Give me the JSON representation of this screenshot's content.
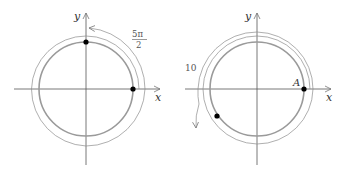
{
  "left_diagram": {
    "axis_x_label": "x",
    "axis_y_label": "y",
    "angle_label_numerator": "5π",
    "angle_label_denominator": "2",
    "points": [
      "start-point-x-axis",
      "end-point-y-axis"
    ]
  },
  "right_diagram": {
    "axis_x_label": "x",
    "axis_y_label": "y",
    "point_label": "A",
    "angle_label": "10",
    "points": [
      "point-A",
      "end-point-third-quadrant"
    ]
  },
  "colors": {
    "circle": "#9a9a9a",
    "spiral": "#8c8c8c",
    "axis": "#555555",
    "point": "#000000"
  }
}
